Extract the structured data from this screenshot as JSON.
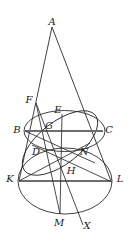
{
  "figure": {
    "width": 131,
    "height": 241,
    "background": "#ffffff",
    "stroke_color": "#2b2b2b",
    "thick_stroke_color": "#6e6e6e",
    "label_color": "#1a1a1a"
  },
  "points": [
    {
      "id": "A",
      "label": "A",
      "x": 52,
      "y": 27,
      "lx": 52,
      "ly": 22
    },
    {
      "id": "F",
      "label": "F",
      "x": 36,
      "y": 103,
      "lx": 29,
      "ly": 100
    },
    {
      "id": "E",
      "label": "E",
      "x": 62,
      "y": 114,
      "lx": 58,
      "ly": 110
    },
    {
      "id": "B",
      "label": "B",
      "x": 25,
      "y": 131,
      "lx": 18,
      "ly": 130
    },
    {
      "id": "G",
      "label": "G",
      "x": 50,
      "y": 130,
      "lx": 49,
      "ly": 126
    },
    {
      "id": "C",
      "label": "C",
      "x": 103,
      "y": 131,
      "lx": 108,
      "ly": 130
    },
    {
      "id": "D",
      "label": "D",
      "x": 42,
      "y": 149,
      "lx": 36,
      "ly": 152
    },
    {
      "id": "N",
      "label": "N",
      "x": 80,
      "y": 148,
      "lx": 84,
      "ly": 152
    },
    {
      "id": "K",
      "label": "K",
      "x": 19,
      "y": 181,
      "lx": 11,
      "ly": 179
    },
    {
      "id": "H",
      "label": "H",
      "x": 67,
      "y": 181,
      "lx": 71,
      "ly": 171
    },
    {
      "id": "L",
      "label": "L",
      "x": 111,
      "y": 181,
      "lx": 119,
      "ly": 179
    },
    {
      "id": "M",
      "label": "M",
      "x": 60,
      "y": 214,
      "lx": 59,
      "ly": 223
    },
    {
      "id": "X",
      "label": "X",
      "x": 83,
      "y": 225,
      "lx": 86,
      "ly": 226
    }
  ],
  "ellipses": [
    {
      "name": "upper-circle",
      "cx": 64.5,
      "cy": 131,
      "rx": 40.5,
      "ry": 20.5,
      "rotation": 0
    },
    {
      "name": "lower-circle",
      "cx": 65,
      "cy": 181,
      "rx": 47,
      "ry": 33,
      "rotation": 0
    },
    {
      "name": "section-ellipse",
      "cx": 60,
      "cy": 143,
      "rx": 45,
      "ry": 21,
      "rotation": -38
    }
  ],
  "segments": [
    {
      "name": "cone-left-side",
      "x1": 52,
      "y1": 27,
      "x2": 19,
      "y2": 181,
      "thick": false
    },
    {
      "name": "cone-right-side",
      "x1": 52,
      "y1": 27,
      "x2": 111,
      "y2": 181,
      "thick": false
    },
    {
      "name": "chord-BC",
      "x1": 25,
      "y1": 131,
      "x2": 103,
      "y2": 131,
      "thick": true
    },
    {
      "name": "chord-KL",
      "x1": 19,
      "y1": 181,
      "x2": 111,
      "y2": 181,
      "thick": true
    },
    {
      "name": "line-FM",
      "x1": 36,
      "y1": 103,
      "x2": 60,
      "y2": 214,
      "thick": false
    },
    {
      "name": "line-FX",
      "x1": 36,
      "y1": 103,
      "x2": 83,
      "y2": 225,
      "thick": false
    },
    {
      "name": "line-EM",
      "x1": 62,
      "y1": 114,
      "x2": 60,
      "y2": 214,
      "thick": false
    },
    {
      "name": "line-BN",
      "x1": 25,
      "y1": 131,
      "x2": 93,
      "y2": 162,
      "thick": false
    },
    {
      "name": "line-DL",
      "x1": 34,
      "y1": 146,
      "x2": 111,
      "y2": 181,
      "thick": false
    },
    {
      "name": "line-KN",
      "x1": 19,
      "y1": 181,
      "x2": 88,
      "y2": 144,
      "thick": false
    }
  ],
  "labels_legend": {
    "apex": "A",
    "section_points": [
      "F",
      "E",
      "D",
      "N"
    ],
    "upper_circle_points": [
      "B",
      "C",
      "G"
    ],
    "lower_circle_points": [
      "K",
      "L",
      "H",
      "M"
    ],
    "extension_point": "X"
  }
}
